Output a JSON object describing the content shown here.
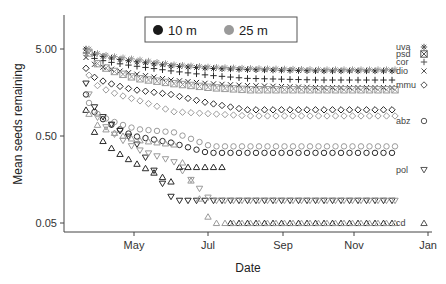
{
  "chart_data": {
    "type": "scatter",
    "title": "",
    "xlabel": "Date",
    "ylabel": "Mean seeds remaining",
    "yscale": "log",
    "ylim": [
      0.04,
      12
    ],
    "y_ticks": [
      {
        "value": 5.0,
        "label": "5.00"
      },
      {
        "value": 0.5,
        "label": "0.50"
      },
      {
        "value": 0.05,
        "label": "0.05"
      }
    ],
    "x_ticks": [
      "May",
      "Jul",
      "Sep",
      "Nov",
      "Jan"
    ],
    "grid": false,
    "legend": {
      "position": "top-center",
      "entries": [
        {
          "label": "10 m",
          "color": "#1a1a1a"
        },
        {
          "label": "25 m",
          "color": "#9a9a9a"
        }
      ]
    },
    "species": [
      {
        "code": "uva",
        "symbol": "asterisk",
        "final_value": 2.8
      },
      {
        "code": "psd",
        "symbol": "square-x",
        "final_value": 2.5
      },
      {
        "code": "cor",
        "symbol": "plus",
        "final_value": 2.2
      },
      {
        "code": "dio",
        "symbol": "x",
        "final_value": 1.8
      },
      {
        "code": "mmu",
        "symbol": "diamond",
        "final_value": 1.0
      },
      {
        "code": "abz",
        "symbol": "circle",
        "final_value": 0.32
      },
      {
        "code": "pol",
        "symbol": "triangle-down",
        "final_value": 0.09
      },
      {
        "code": "cd",
        "symbol": "triangle-up",
        "final_value": 0.05
      }
    ],
    "series": [
      {
        "name": "uva 10 m",
        "distance": "10 m",
        "species": "uva",
        "approx_values": [
          5.0,
          3.6,
          3.2,
          3.0,
          2.9,
          2.8,
          2.8
        ]
      },
      {
        "name": "uva 25 m",
        "distance": "25 m",
        "species": "uva",
        "approx_values": [
          5.0,
          3.8,
          3.3,
          3.1,
          3.0,
          2.9,
          2.9
        ]
      },
      {
        "name": "cor 10 m",
        "distance": "10 m",
        "species": "cor",
        "approx_values": [
          4.5,
          3.2,
          2.8,
          2.5,
          2.3,
          2.2,
          2.2
        ]
      },
      {
        "name": "dio 10 m",
        "distance": "10 m",
        "species": "dio",
        "approx_values": [
          4.0,
          2.6,
          2.2,
          2.0,
          1.9,
          1.8,
          1.8
        ]
      },
      {
        "name": "psd 25 m",
        "distance": "25 m",
        "species": "psd",
        "approx_values": [
          4.5,
          2.3,
          2.0,
          1.8,
          1.7,
          1.7,
          1.7
        ]
      },
      {
        "name": "mmu 10 m",
        "distance": "10 m",
        "species": "mmu",
        "approx_values": [
          3.0,
          1.7,
          1.5,
          1.2,
          1.0,
          1.0,
          1.0
        ]
      },
      {
        "name": "mmu 25 m",
        "distance": "25 m",
        "species": "mmu",
        "approx_values": [
          2.5,
          1.3,
          0.95,
          0.9,
          0.85,
          0.85,
          0.85
        ]
      },
      {
        "name": "abz 10 m",
        "distance": "10 m",
        "species": "abz",
        "approx_values": [
          1.5,
          0.5,
          0.42,
          0.32,
          0.32,
          0.32,
          0.32
        ]
      },
      {
        "name": "abz 25 m",
        "distance": "25 m",
        "species": "abz",
        "approx_values": [
          1.2,
          0.6,
          0.55,
          0.38,
          0.38,
          0.38,
          0.38
        ]
      },
      {
        "name": "pol 10 m",
        "distance": "10 m",
        "species": "pol",
        "approx_values": [
          2.0,
          0.45,
          0.1,
          0.09,
          0.09,
          0.09,
          0.09
        ]
      },
      {
        "name": "pol 25 m",
        "distance": "25 m",
        "species": "pol",
        "approx_values": [
          1.5,
          0.35,
          0.25,
          0.09,
          0.09,
          0.09,
          0.09
        ]
      },
      {
        "name": "cd 10 m",
        "distance": "10 m",
        "species": "cd",
        "approx_values": [
          1.0,
          0.25,
          0.15,
          0.05,
          0.05,
          0.05,
          0.05
        ]
      },
      {
        "name": "cd 25 m",
        "distance": "25 m",
        "species": "cd",
        "approx_values": [
          0.9,
          0.45,
          0.4,
          0.05,
          0.05,
          0.05,
          0.05
        ]
      }
    ],
    "x_sample_dates": [
      "mid-Apr",
      "May",
      "Jun",
      "Jul",
      "Aug",
      "Oct",
      "Dec"
    ]
  }
}
